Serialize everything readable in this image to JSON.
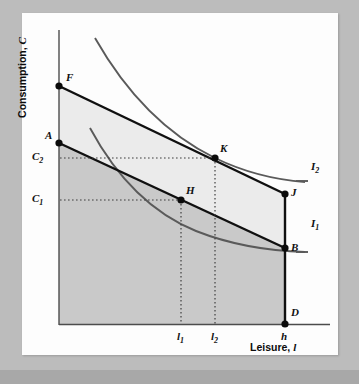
{
  "figure": {
    "type": "economics-indifference-curve-diagram",
    "axes": {
      "y_title_text": "Consumption, ",
      "y_title_symbol": "C",
      "x_title_text": "Leisure, ",
      "x_title_symbol": "l"
    },
    "colors": {
      "card_background": "#fdfdfd",
      "page_background": "#bcbcbc",
      "axis_line": "#4c4c4c",
      "budget_line": "#111111",
      "indifference_curve": "#555555",
      "shade_upper": "#ebebeb",
      "shade_lower": "#c9c9c9",
      "dotted_guide": "#4a4a4a"
    },
    "point_labels": [
      {
        "id": "F",
        "text": "F",
        "x": 59,
        "y": 86,
        "lx": 66,
        "ly": 72
      },
      {
        "id": "A",
        "text": "A",
        "x": 59,
        "y": 143,
        "lx": 46,
        "ly": 131
      },
      {
        "id": "K",
        "text": "K",
        "x": 215,
        "y": 158,
        "lx": 220,
        "ly": 143
      },
      {
        "id": "H",
        "text": "H",
        "x": 181,
        "y": 200,
        "lx": 187,
        "ly": 185
      },
      {
        "id": "J",
        "text": "J",
        "x": 285,
        "y": 194,
        "lx": 291,
        "ly": 187
      },
      {
        "id": "B",
        "text": "B",
        "x": 285,
        "y": 248,
        "lx": 291,
        "ly": 243
      },
      {
        "id": "D",
        "text": "D",
        "x": 285,
        "y": 324,
        "lx": 291,
        "ly": 308
      }
    ],
    "curve_labels": [
      {
        "id": "I2",
        "text": "I",
        "sub": "2",
        "lx": 311,
        "ly": 167
      },
      {
        "id": "I1",
        "text": "I",
        "sub": "1",
        "lx": 311,
        "ly": 224
      }
    ],
    "tick_labels_y": [
      {
        "id": "C2",
        "text": "C",
        "sub": "2",
        "lx": 33,
        "ly": 152,
        "y": 158
      },
      {
        "id": "C1",
        "text": "C",
        "sub": "1",
        "lx": 33,
        "ly": 194,
        "y": 200
      }
    ],
    "tick_labels_x": [
      {
        "id": "l1",
        "text": "l",
        "sub": "1",
        "lx": 177,
        "ly": 332,
        "x": 181
      },
      {
        "id": "l2",
        "text": "l",
        "sub": "2",
        "lx": 211,
        "ly": 332,
        "x": 215
      },
      {
        "id": "h",
        "text": "h",
        "sub": "",
        "lx": 281,
        "ly": 332,
        "x": 285
      }
    ],
    "geometry": {
      "origin": {
        "x": 59,
        "y": 325
      },
      "x_axis_end": 330,
      "y_axis_top": 30,
      "budget_line_FJ": [
        {
          "x": 59,
          "y": 86
        },
        {
          "x": 285,
          "y": 194
        }
      ],
      "budget_line_AB": [
        {
          "x": 59,
          "y": 143
        },
        {
          "x": 285,
          "y": 248
        }
      ],
      "vertical_JD": [
        {
          "x": 285,
          "y": 194
        },
        {
          "x": 285,
          "y": 324
        }
      ],
      "indifference_curve_I2": "M95,38 C128,96 170,136 215,158 C248,174 278,180 305,182",
      "indifference_curve_I1": "M90,128 C118,180 154,214 196,231 C234,246 272,251 305,252"
    }
  }
}
